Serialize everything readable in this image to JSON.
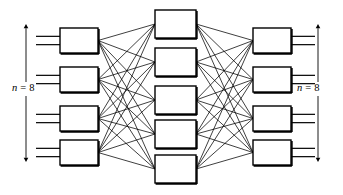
{
  "diagram": {
    "type": "neural-network-layer-diagram",
    "title": "",
    "background_color": "#ffffff",
    "stroke_color": "#000000",
    "box_fill_color": "#ffffff",
    "canvas": {
      "width": 343,
      "height": 195
    },
    "labels": {
      "left": {
        "variable": "n",
        "equals": "=",
        "value": "8",
        "full_text": "n = 8"
      },
      "right": {
        "variable": "n",
        "equals": "=",
        "value": "8",
        "full_text": "n = 8"
      }
    },
    "arrows": {
      "left": {
        "x": 26,
        "top_y": 24,
        "bottom_y": 162,
        "double_headed": true
      },
      "right": {
        "x": 318,
        "top_y": 24,
        "bottom_y": 162,
        "double_headed": true
      }
    },
    "layers": [
      {
        "name": "input-layer",
        "position": "left",
        "count": 4,
        "box_width": 38,
        "box_height": 25,
        "x": 60,
        "y_positions": [
          28,
          67,
          106,
          140
        ],
        "stub_lines_per_box": 2,
        "stub_side": "left",
        "stub_start_x": 36
      },
      {
        "name": "hidden-layer",
        "position": "middle",
        "count": 5,
        "box_width": 41,
        "box_height": 28,
        "x": 155,
        "y_positions": [
          10,
          48,
          86,
          120,
          155
        ],
        "stub_lines_per_box": 0,
        "stub_side": "none",
        "stub_start_x": 0
      },
      {
        "name": "output-layer",
        "position": "right",
        "count": 4,
        "box_width": 38,
        "box_height": 25,
        "x": 253,
        "y_positions": [
          28,
          67,
          106,
          140
        ],
        "stub_lines_per_box": 2,
        "stub_side": "right",
        "stub_start_x": 315
      }
    ],
    "connections": [
      {
        "from": "input-layer",
        "to": "hidden-layer",
        "pattern": "fully-connected",
        "line_count": 20
      },
      {
        "from": "hidden-layer",
        "to": "output-layer",
        "pattern": "fully-connected",
        "line_count": 20
      }
    ]
  }
}
